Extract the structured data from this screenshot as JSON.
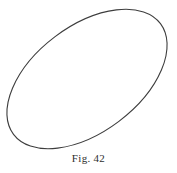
{
  "figure": {
    "caption": "Fig. 42",
    "background_color": "#ffffff",
    "stroke_color": "#3d3d3d",
    "stroke_width": 1.1,
    "shape_name": "tilted-ellipse"
  },
  "chart_data": {
    "type": "line",
    "title": "Fig. 42",
    "subtitle": "",
    "xlabel": "",
    "ylabel": "",
    "grid": false,
    "legend": "none",
    "annotations": [
      "Fig. 42"
    ],
    "shapes": [
      {
        "kind": "ellipse",
        "center_x": 87,
        "center_y": 79,
        "semi_major": 92,
        "semi_minor": 53,
        "rotation_deg": -37,
        "filled": false,
        "stroke": "#3d3d3d"
      }
    ],
    "extents": {
      "left_x": 6,
      "right_x": 168,
      "top_y": 11,
      "bottom_y": 148
    },
    "axis_endpoints": {
      "major_axis": [
        [
          15,
          134
        ],
        [
          159,
          24
        ]
      ],
      "minor_axis": [
        [
          55,
          36
        ],
        [
          119,
          122
        ]
      ]
    },
    "xlim": [
      0,
      177
    ],
    "ylim": [
      0,
      173
    ]
  }
}
